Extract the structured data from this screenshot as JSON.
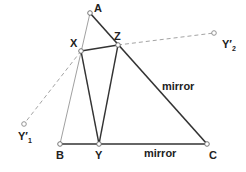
{
  "diagram": {
    "points": {
      "A": {
        "label": "A",
        "x": 90,
        "y": 13
      },
      "B": {
        "label": "B",
        "x": 60,
        "y": 144
      },
      "C": {
        "label": "C",
        "x": 207,
        "y": 144
      },
      "X": {
        "label": "X",
        "x": 81,
        "y": 51
      },
      "Y": {
        "label": "Y",
        "x": 99,
        "y": 144
      },
      "Z": {
        "label": "Z",
        "x": 118,
        "y": 45
      },
      "Y1": {
        "label": "Y′",
        "sub": "1",
        "x": 24,
        "y": 124
      },
      "Y2": {
        "label": "Y′",
        "sub": "2",
        "x": 214,
        "y": 33
      }
    },
    "mirror_labels": {
      "ac": "mirror",
      "bc": "mirror"
    },
    "colors": {
      "line": "#333333",
      "thin_line": "#777777",
      "dashed": "#999999",
      "point_fill": "#ffffff",
      "point_stroke": "#666666"
    }
  }
}
